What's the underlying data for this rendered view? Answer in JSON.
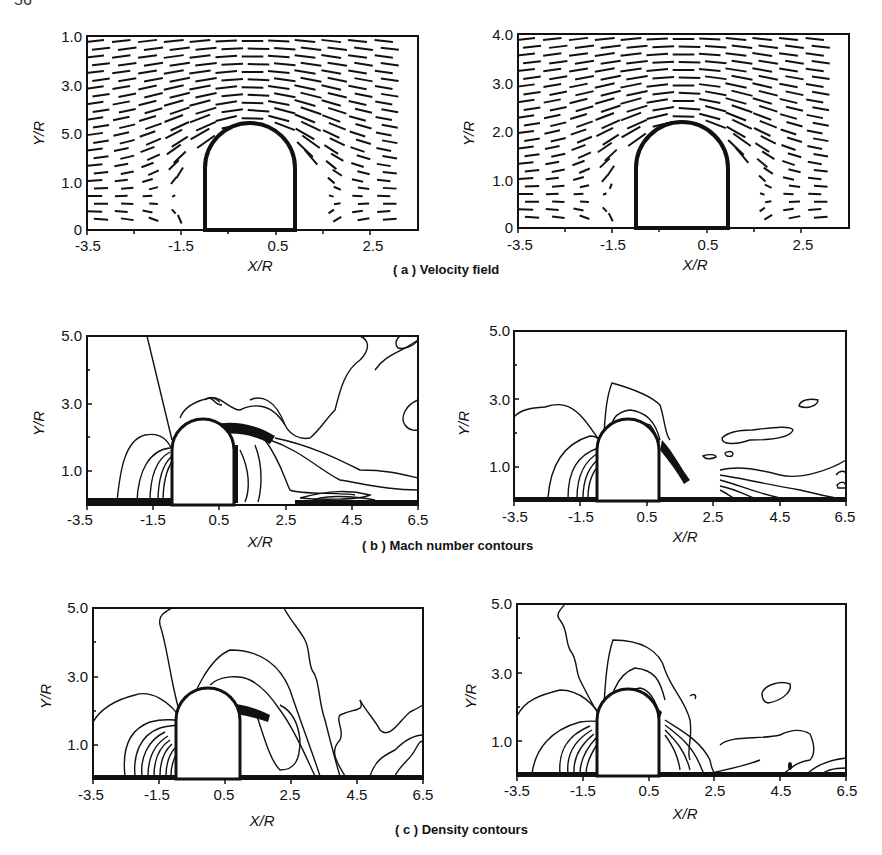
{
  "page_number": "56",
  "captions": {
    "a": "( a ) Velocity field",
    "b": "( b ) Mach number contours",
    "c": "( c ) Density contours"
  },
  "chart_data": [
    {
      "id": "a-left",
      "type": "quiver",
      "title": "( a ) Velocity field",
      "xlabel": "X/R",
      "ylabel": "Y/R",
      "xticks": [
        "-3.5",
        "-1.5",
        "0.5",
        "2.5"
      ],
      "yticks": [
        "0",
        "1.0",
        "5.0",
        "3.0",
        "1.0"
      ],
      "xlim": [
        -3.5,
        3.5
      ],
      "ylim": [
        0,
        4.0
      ],
      "body": "semicircular-capped cylinder at x≈-0.9..1.0, top y≈2.1"
    },
    {
      "id": "a-right",
      "type": "quiver",
      "title": "( a ) Velocity field",
      "xlabel": "X/R",
      "ylabel": "Y/R",
      "xticks": [
        "-3.5",
        "-1.5",
        "0.5",
        "2.5"
      ],
      "yticks": [
        "0",
        "1.0",
        "2.0",
        "3.0",
        "4.0"
      ],
      "xlim": [
        -3.5,
        3.5
      ],
      "ylim": [
        0,
        4.0
      ],
      "body": "semicircular-capped cylinder at x≈-0.9..1.0, top y≈2.1"
    },
    {
      "id": "b-left",
      "type": "contour",
      "title": "( b ) Mach number contours",
      "xlabel": "X/R",
      "ylabel": "Y/R",
      "xticks": [
        "-3.5",
        "-1.5",
        "0.5",
        "2.5",
        "4.5",
        "6.5"
      ],
      "yticks": [
        "1.0",
        "3.0",
        "5.0"
      ],
      "xlim": [
        -3.5,
        6.5
      ],
      "ylim": [
        0,
        5.0
      ]
    },
    {
      "id": "b-right",
      "type": "contour",
      "title": "( b ) Mach number contours",
      "xlabel": "X/R",
      "ylabel": "Y/R",
      "xticks": [
        "-3.5",
        "-1.5",
        "0.5",
        "2.5",
        "4.5",
        "6.5"
      ],
      "yticks": [
        "1.0",
        "3.0",
        "5.0"
      ],
      "xlim": [
        -3.5,
        6.5
      ],
      "ylim": [
        0,
        5.0
      ]
    },
    {
      "id": "c-left",
      "type": "contour",
      "title": "( c ) Density contours",
      "xlabel": "X/R",
      "ylabel": "Y/R",
      "xticks": [
        "-3.5",
        "-1.5",
        "0.5",
        "2.5",
        "4.5",
        "6.5"
      ],
      "yticks": [
        "1.0",
        "3.0",
        "5.0"
      ],
      "xlim": [
        -3.5,
        6.5
      ],
      "ylim": [
        0,
        5.0
      ]
    },
    {
      "id": "c-right",
      "type": "contour",
      "title": "( c ) Density contours",
      "xlabel": "X/R",
      "ylabel": "Y/R",
      "xticks": [
        "-3.5",
        "-1.5",
        "0.5",
        "2.5",
        "4.5",
        "6.5"
      ],
      "yticks": [
        "1.0",
        "3.0",
        "5.0"
      ],
      "xlim": [
        -3.5,
        6.5
      ],
      "ylim": [
        0,
        5.0
      ]
    }
  ]
}
